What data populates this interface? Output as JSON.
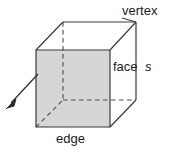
{
  "figure": {
    "type": "geometry-diagram",
    "background_color": "#ffffff",
    "line_color": "#3a3a3a",
    "face_fill_color": "#d6d6d6",
    "text_color": "#1a1a1a"
  },
  "labels": {
    "vertex": "vertex",
    "face": "face",
    "side_length": "s",
    "edge": "edge"
  },
  "geometry": {
    "front_face": {
      "top_left": [
        36,
        50
      ],
      "top_right": [
        110,
        50
      ],
      "bottom_right": [
        110,
        127
      ],
      "bottom_left": [
        36,
        127
      ]
    },
    "back_face": {
      "top_left": [
        63,
        22
      ],
      "top_right": [
        136,
        22
      ],
      "bottom_right": [
        136,
        100
      ],
      "bottom_left": [
        63,
        100
      ]
    },
    "hidden_edges": [
      {
        "name": "vertical-back-left",
        "from": [
          63,
          22
        ],
        "to": [
          63,
          100
        ]
      },
      {
        "name": "horizontal-back-bottom",
        "from": [
          63,
          100
        ],
        "to": [
          136,
          100
        ]
      },
      {
        "name": "diagonal-bottom-left",
        "from": [
          36,
          127
        ],
        "to": [
          63,
          100
        ]
      }
    ],
    "arrow": {
      "from": [
        38,
        75
      ],
      "to": [
        7,
        107
      ]
    },
    "vertex_leader": {
      "from": [
        136,
        22
      ],
      "to": [
        124,
        14
      ]
    }
  }
}
